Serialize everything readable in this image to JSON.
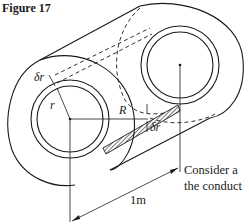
{
  "figure": {
    "title": "Figure 17",
    "labels": {
      "delta_r_top": "δr",
      "r": "r",
      "R": "R",
      "delta_r_bottom": "δr",
      "length": "1m"
    },
    "caption_lines": [
      "Consider a",
      "the conduct"
    ]
  }
}
